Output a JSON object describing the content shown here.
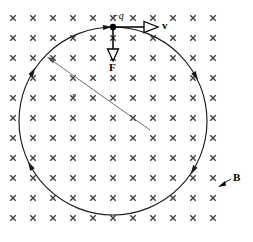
{
  "figure": {
    "width": 253,
    "height": 242,
    "background_color": "#ffffff"
  },
  "labels": {
    "charge": "−q",
    "velocity": "v",
    "force": "F",
    "field": "B",
    "radius": "r"
  },
  "colors": {
    "ink": "#000000",
    "orbit": "#1a1a1a",
    "field_mark": "#3a3a3a",
    "radius_line": "#555555"
  },
  "chart_data": {
    "type": "diagram",
    "orbit": {
      "shape": "circle",
      "center": [
        113,
        121
      ],
      "radius": 94,
      "direction": "clockwise",
      "arrowhead_angles_deg": [
        150,
        210,
        330,
        30,
        95
      ]
    },
    "particle": {
      "label": "−q",
      "sign": "negative",
      "position": [
        113,
        27
      ]
    },
    "vectors": [
      {
        "name": "velocity",
        "label": "v",
        "from": [
          113,
          27
        ],
        "to": [
          157,
          27
        ],
        "direction": "right",
        "arrowhead": "open-triangle",
        "label_position": [
          163,
          22
        ]
      },
      {
        "name": "force",
        "label": "F",
        "from": [
          113,
          27
        ],
        "to": [
          113,
          60
        ],
        "direction": "down",
        "arrowhead": "open-triangle",
        "label_position": [
          109,
          63
        ]
      }
    ],
    "radius_annotation": {
      "label": "r",
      "from": [
        150,
        130
      ],
      "to": [
        47,
        57
      ],
      "label_position": [
        73,
        96
      ]
    },
    "field": {
      "label": "B",
      "symbol": "×",
      "orientation": "into-page",
      "grid_columns": 11,
      "grid_rows": 11,
      "grid_origin": [
        13,
        18
      ],
      "grid_spacing": 20,
      "label_position": [
        232,
        177
      ],
      "pointer_from": [
        230,
        180
      ],
      "pointer_to": [
        219,
        186
      ]
    }
  }
}
